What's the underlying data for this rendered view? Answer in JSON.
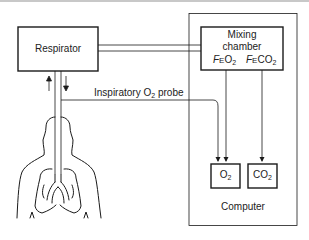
{
  "diagram": {
    "respirator": {
      "label": "Respirator"
    },
    "mixing_chamber": {
      "label_line1": "Mixing",
      "label_line2": "chamber",
      "feo2": {
        "prefix": "F",
        "sub_e": "E",
        "base": "O",
        "sub": "2"
      },
      "feco2": {
        "prefix": "F",
        "sub_e": "E",
        "base": "CO",
        "sub": "2"
      }
    },
    "probe": {
      "label_pre": "Inspiratory O",
      "label_sub": "2",
      "label_post": " probe"
    },
    "o2_analyzer": {
      "base": "O",
      "sub": "2"
    },
    "co2_analyzer": {
      "base": "CO",
      "sub": "2"
    },
    "computer": {
      "label": "Computer"
    },
    "colors": {
      "line": "#1a1a1a",
      "background": "#ffffff",
      "topline": "#c8c8c8"
    }
  }
}
